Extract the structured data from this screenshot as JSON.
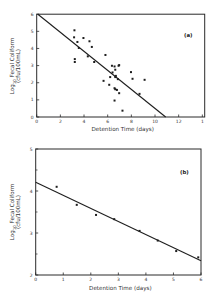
{
  "chart_data": [
    {
      "id": "a",
      "type": "scatter",
      "panel_label": "(a)",
      "title": "",
      "xlabel": "Detention Time (days)",
      "ylabel_line1": "Log",
      "ylabel_sub": "10",
      "ylabel_line1_rest": " Fecal Coliform",
      "ylabel_line2": "(cfu/100mL)",
      "xlim": [
        0,
        14.2
      ],
      "ylim": [
        0,
        6
      ],
      "xticks": [
        0,
        2,
        4,
        6,
        8,
        10,
        12,
        14
      ],
      "xtick_labels": [
        "0",
        "2",
        "4",
        "6",
        "8",
        "10",
        "12",
        "1"
      ],
      "yticks": [
        0,
        1,
        2,
        3,
        4,
        5,
        6
      ],
      "ytick_labels": [
        "0",
        "1",
        "2",
        "3",
        "4",
        "5",
        "6"
      ],
      "grid": false,
      "legend": null,
      "series": [
        {
          "name": "observations",
          "points": [
            [
              3.19,
              5.06
            ],
            [
              3.16,
              4.65
            ],
            [
              3.44,
              4.38
            ],
            [
              3.95,
              4.61
            ],
            [
              4.46,
              4.42
            ],
            [
              4.66,
              4.09
            ],
            [
              3.22,
              3.38
            ],
            [
              3.22,
              3.21
            ],
            [
              4.32,
              3.54
            ],
            [
              4.86,
              3.21
            ],
            [
              3.56,
              4.03
            ],
            [
              5.81,
              3.62
            ],
            [
              6.36,
              2.99
            ],
            [
              6.58,
              2.95
            ],
            [
              6.92,
              2.99
            ],
            [
              7.97,
              2.62
            ],
            [
              5.65,
              2.11
            ],
            [
              6.21,
              2.33
            ],
            [
              6.69,
              2.4
            ],
            [
              6.86,
              2.21
            ],
            [
              6.13,
              1.88
            ],
            [
              6.64,
              1.62
            ],
            [
              6.97,
              1.39
            ],
            [
              8.1,
              2.23
            ],
            [
              9.12,
              2.17
            ],
            [
              8.69,
              1.35
            ],
            [
              6.58,
              0.96
            ],
            [
              7.25,
              0.37
            ],
            [
              6.41,
              2.6
            ],
            [
              6.64,
              2.33
            ],
            [
              6.58,
              1.68
            ],
            [
              6.78,
              1.58
            ],
            [
              6.64,
              2.76
            ],
            [
              6.97,
              3.03
            ]
          ]
        },
        {
          "name": "fitted line",
          "type": "line",
          "points": [
            [
              0.1,
              6.0
            ],
            [
              10.9,
              0.0
            ]
          ]
        }
      ]
    },
    {
      "id": "b",
      "type": "scatter",
      "panel_label": "(b)",
      "title": "",
      "xlabel": "Detention Time (days)",
      "ylabel_line1": "Log",
      "ylabel_sub": "10",
      "ylabel_line1_rest": " Fecal Coliform",
      "ylabel_line2": "(cfu/100mL)",
      "xlim": [
        0,
        6
      ],
      "ylim": [
        2,
        5
      ],
      "xticks": [
        0,
        1,
        2,
        3,
        4,
        5,
        6
      ],
      "xtick_labels": [
        "0",
        "1",
        "2",
        "3",
        "4",
        "5",
        "6"
      ],
      "yticks": [
        2,
        3,
        4,
        5
      ],
      "ytick_labels": [
        "2",
        "3",
        "4",
        "5"
      ],
      "yminor_ticks": [
        2.5,
        3.5,
        4.5
      ],
      "grid": false,
      "legend": null,
      "series": [
        {
          "name": "observations",
          "points": [
            [
              0.76,
              4.1
            ],
            [
              1.49,
              3.67
            ],
            [
              2.19,
              3.43
            ],
            [
              2.85,
              3.33
            ],
            [
              3.77,
              3.05
            ],
            [
              4.43,
              2.82
            ],
            [
              5.1,
              2.57
            ],
            [
              5.9,
              2.42
            ]
          ]
        },
        {
          "name": "fitted line",
          "type": "line",
          "points": [
            [
              0.0,
              4.21
            ],
            [
              6.0,
              2.34
            ]
          ]
        }
      ]
    }
  ]
}
